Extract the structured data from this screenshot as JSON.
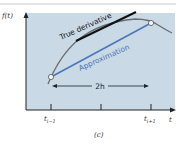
{
  "figure": {
    "y_axis_label": "f(t)",
    "x_axis_label": "t",
    "tangent_label": "True derivative",
    "secant_label": "Approximation",
    "interval_label": "2h",
    "tick_left_base": "t",
    "tick_left_sub": "i−1",
    "tick_right_base": "t",
    "tick_right_sub": "i+1",
    "caption": "(c)",
    "colors": {
      "panel": "#c9d9e6",
      "curve": "#6a6e72",
      "tangent": "#111111",
      "secant": "#4a78b8",
      "axis": "#222222",
      "rule": "#c8ccd0"
    }
  }
}
